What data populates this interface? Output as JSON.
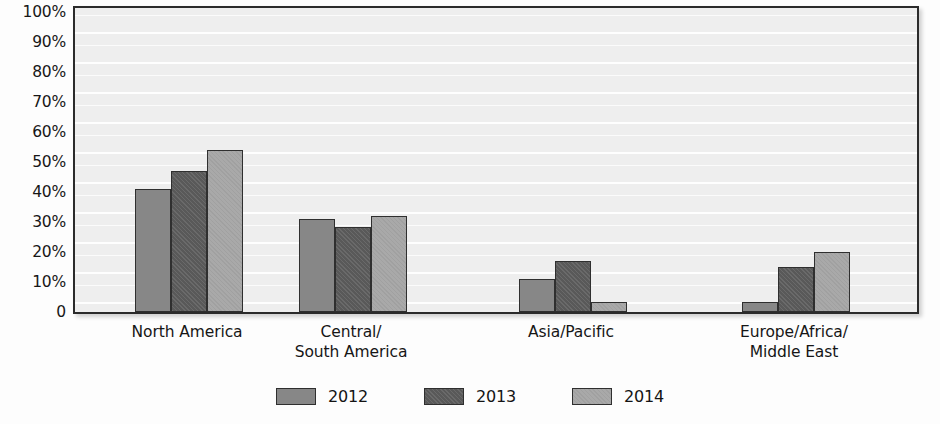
{
  "chart_data": {
    "type": "bar",
    "title": "",
    "xlabel": "",
    "ylabel": "",
    "ylim": [
      0,
      100
    ],
    "grid": true,
    "legend_position": "bottom",
    "categories": [
      "North America",
      "Central/\nSouth America",
      "Asia/Pacific",
      "Europe/Africa/\nMiddle East"
    ],
    "category_lines": [
      [
        "North America"
      ],
      [
        "Central/",
        "South America"
      ],
      [
        "Asia/Pacific"
      ],
      [
        "Europe/Africa/",
        "Middle East"
      ]
    ],
    "series": [
      {
        "name": "2012",
        "color": "#878787",
        "values": [
          41,
          31,
          11,
          3.5
        ]
      },
      {
        "name": "2013",
        "color": "#595959",
        "values": [
          47,
          28.5,
          17,
          15
        ]
      },
      {
        "name": "2014",
        "color": "#a9a9a9",
        "values": [
          54,
          32,
          3.5,
          20
        ]
      }
    ],
    "ytick_labels": [
      "100%",
      "90%",
      "80%",
      "70%",
      "60%",
      "50%",
      "40%",
      "30%",
      "20%",
      "10%",
      "0"
    ],
    "ytick_values": [
      100,
      90,
      80,
      70,
      60,
      50,
      40,
      30,
      20,
      10,
      0
    ]
  },
  "legend": {
    "items": [
      {
        "label": "2012",
        "color": "#878787"
      },
      {
        "label": "2013",
        "color": "#595959"
      },
      {
        "label": "2014",
        "color": "#a9a9a9"
      }
    ]
  },
  "colors": {
    "plot_background": "#eeeeee",
    "axis_border": "#2b2b2b",
    "bar_border": "#2f2f2f",
    "text": "#161616"
  }
}
